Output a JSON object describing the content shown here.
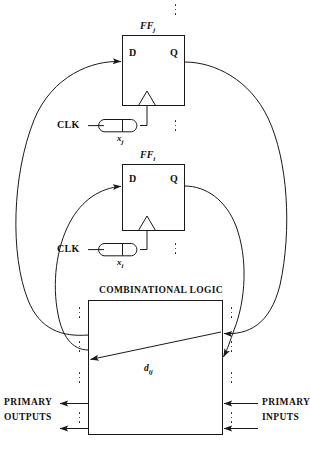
{
  "diagram": {
    "line_color": "#1a1a1a",
    "background": "#ffffff"
  },
  "flipflops": [
    {
      "id": "ff_j",
      "name": "FF",
      "name_sub": "j",
      "d_label": "D",
      "q_label": "Q",
      "clock_label": "CLK",
      "gate_label": "x",
      "gate_sub": "j"
    },
    {
      "id": "ff_i",
      "name": "FF",
      "name_sub": "i",
      "d_label": "D",
      "q_label": "Q",
      "clock_label": "CLK",
      "gate_label": "x",
      "gate_sub": "i"
    }
  ],
  "combinational": {
    "title": "COMBINATIONAL LOGIC",
    "path_label": "d",
    "path_sub": "ij"
  },
  "io": {
    "outputs_line1": "PRIMARY",
    "outputs_line2": "OUTPUTS",
    "inputs_line1": "PRIMARY",
    "inputs_line2": "INPUTS"
  }
}
